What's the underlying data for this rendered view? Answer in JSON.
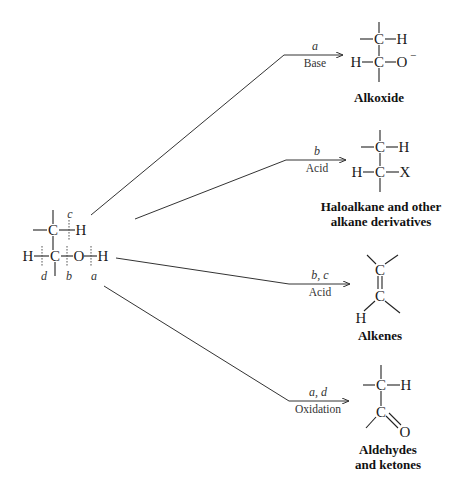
{
  "reactant": {
    "name": "alcohol",
    "atoms": {
      "top_c": "C",
      "top_h": "H",
      "bottom_h": "H",
      "bottom_c": "C",
      "o": "O",
      "oh_h": "H"
    },
    "cleavage_labels": {
      "a": "a",
      "b": "b",
      "c": "c",
      "d": "d"
    }
  },
  "reactions": [
    {
      "id": "alkoxide",
      "bonds_broken": "a",
      "reagent": "Base",
      "product_name": "Alkoxide",
      "product_atoms": {
        "c1": "C",
        "h1": "H",
        "h2": "H",
        "c2": "C",
        "o": "O",
        "charge": "−"
      }
    },
    {
      "id": "haloalkane",
      "bonds_broken": "b",
      "reagent": "Acid",
      "product_name_line1": "Haloalkane and other",
      "product_name_line2": "alkane derivatives",
      "product_atoms": {
        "c1": "C",
        "h1": "H",
        "h2": "H",
        "c2": "C",
        "x": "X"
      }
    },
    {
      "id": "alkene",
      "bonds_broken": "b, c",
      "reagent": "Acid",
      "product_name": "Alkenes",
      "product_atoms": {
        "c1": "C",
        "c2": "C",
        "h": "H"
      }
    },
    {
      "id": "carbonyl",
      "bonds_broken": "a, d",
      "reagent": "Oxidation",
      "product_name_line1": "Aldehydes",
      "product_name_line2": "and ketones",
      "product_atoms": {
        "c1": "C",
        "h1": "H",
        "c2": "C",
        "o": "O"
      }
    }
  ]
}
